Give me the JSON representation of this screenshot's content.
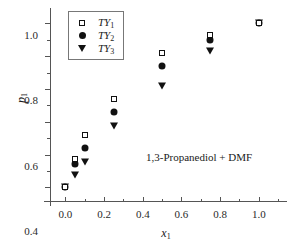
{
  "chart_data": {
    "type": "scatter",
    "title": "",
    "annotation": "1,3-Propanediol + DMF",
    "xlabel": "x",
    "xlabel_sub": "1",
    "ylabel": "p",
    "ylabel_sub": "1",
    "xlim": [
      -0.08,
      1.12
    ],
    "ylim": [
      -0.09,
      1.07
    ],
    "grid": false,
    "legend_position": "top-left",
    "xticks": [
      0.0,
      0.2,
      0.4,
      0.6,
      0.8,
      1.0
    ],
    "xtick_labels": [
      "0.0",
      "0.2",
      "0.4",
      "0.6",
      "0.8",
      "1.0"
    ],
    "xticks_minor": [
      0.1,
      0.3,
      0.5,
      0.7,
      0.9,
      1.1
    ],
    "yticks": [
      0.0,
      0.2,
      0.4,
      0.6,
      0.8,
      1.0
    ],
    "ytick_labels": [
      "0.0",
      "0.2",
      "0.4",
      "0.6",
      "0.8",
      "1.0"
    ],
    "yticks_minor": [
      0.1,
      0.3,
      0.5,
      0.7,
      0.9
    ],
    "series": [
      {
        "name": "TY",
        "name_sub": "1",
        "marker": "open-square",
        "x": [
          0.0,
          0.05,
          0.1,
          0.25,
          0.5,
          0.75,
          1.0
        ],
        "values": [
          0.0,
          0.175,
          0.32,
          0.54,
          0.82,
          0.93,
          1.0
        ]
      },
      {
        "name": "TY",
        "name_sub": "2",
        "marker": "filled-circle",
        "x": [
          0.0,
          0.05,
          0.1,
          0.25,
          0.5,
          0.75,
          1.0
        ],
        "values": [
          0.0,
          0.145,
          0.24,
          0.46,
          0.74,
          0.9,
          1.0
        ]
      },
      {
        "name": "TY",
        "name_sub": "3",
        "marker": "filled-triangle-down",
        "x": [
          0.0,
          0.05,
          0.1,
          0.25,
          0.5,
          0.75,
          1.0
        ],
        "values": [
          0.0,
          0.075,
          0.155,
          0.375,
          0.62,
          0.83,
          1.0
        ]
      }
    ]
  },
  "colors": {
    "marker": "#111111",
    "axis": "#555555",
    "background": "#ffffff"
  }
}
